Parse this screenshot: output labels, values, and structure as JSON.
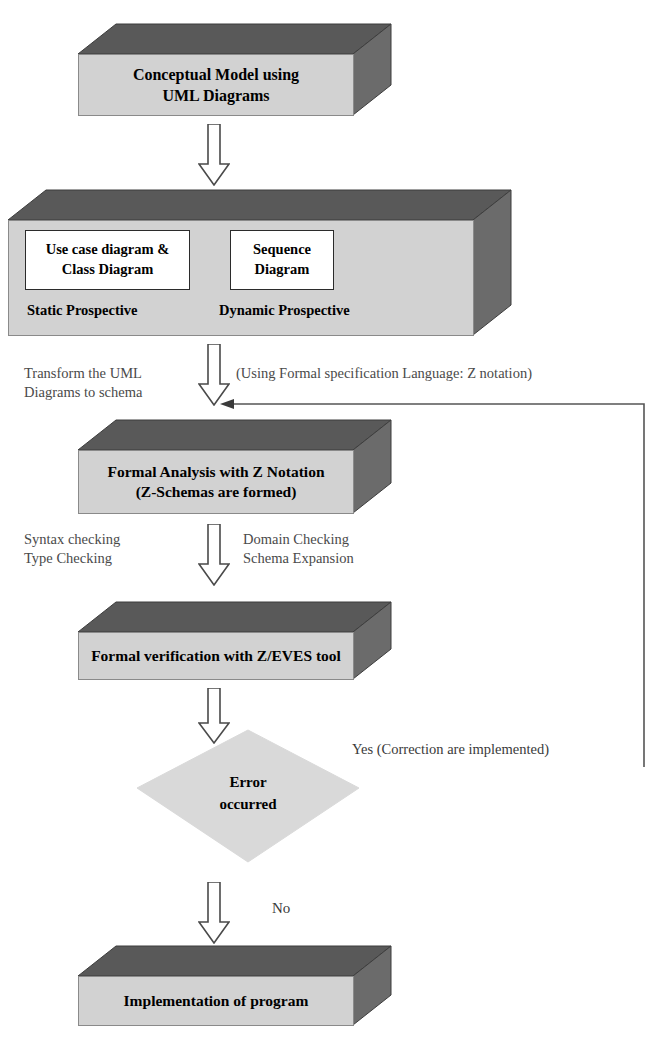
{
  "diagram": {
    "colors": {
      "box_front": "#d2d2d2",
      "box_bevel": "#5a5a5a",
      "box_outline": "#8a8a8a",
      "decision_fill": "#d9d9d9",
      "arrow_outline": "#4a4a4a",
      "arrow_fill": "#ffffff",
      "connector": "#555555",
      "text": "#000000",
      "note_text": "#4a4a4a"
    },
    "nodes": {
      "conceptual_model": {
        "type": "process-box-3d",
        "line1": "Conceptual Model using",
        "line2": "UML Diagrams"
      },
      "perspectives": {
        "type": "process-box-3d",
        "static_box": {
          "line1": "Use case diagram &",
          "line2": "Class Diagram"
        },
        "static_caption": "Static Prospective",
        "dynamic_box": {
          "line1": "Sequence",
          "line2": "Diagram"
        },
        "dynamic_caption": "Dynamic Prospective"
      },
      "formal_analysis": {
        "type": "process-box-3d",
        "line1": "Formal Analysis with Z Notation",
        "line2": "(Z-Schemas are formed)"
      },
      "formal_verification": {
        "type": "process-box-3d",
        "line1": "Formal verification with Z/EVES tool"
      },
      "error_decision": {
        "type": "decision-rhombus",
        "line1": "Error",
        "line2": "occurred"
      },
      "implementation": {
        "type": "process-box-3d",
        "line1": "Implementation of program"
      }
    },
    "annotations": {
      "transform_note": "Transform the UML\nDiagrams to schema",
      "formal_language_note": "(Using Formal specification Language: Z notation)",
      "checking_left": "Syntax checking\nType Checking",
      "checking_right": "Domain Checking\nSchema Expansion",
      "yes_branch": "Yes (Correction are implemented)",
      "no_branch": "No"
    },
    "edges": [
      {
        "from": "conceptual_model",
        "to": "perspectives",
        "style": "block-arrow-down"
      },
      {
        "from": "perspectives",
        "to": "formal_analysis",
        "style": "block-arrow-down"
      },
      {
        "from": "formal_analysis",
        "to": "formal_verification",
        "style": "block-arrow-down"
      },
      {
        "from": "formal_verification",
        "to": "error_decision",
        "style": "block-arrow-down"
      },
      {
        "from": "error_decision",
        "to": "implementation",
        "style": "block-arrow-down",
        "label": "No"
      },
      {
        "from": "error_decision",
        "to": "formal_analysis",
        "style": "feedback-line",
        "label": "Yes (Correction are implemented)"
      }
    ]
  }
}
